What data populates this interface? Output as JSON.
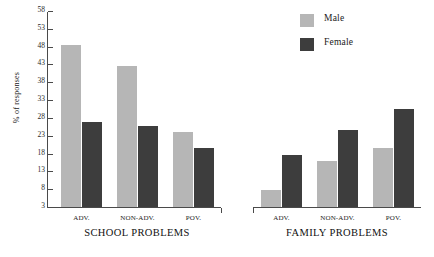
{
  "chart_data": {
    "type": "bar",
    "title": "",
    "xlabel": "",
    "ylabel": "% of responses",
    "ylim": [
      3,
      58
    ],
    "yticks": [
      3,
      8,
      13,
      18,
      23,
      28,
      33,
      38,
      43,
      48,
      53,
      58
    ],
    "grid": false,
    "legend_position": "top-right",
    "categories": [
      "ADV.",
      "NON-ADV.",
      "POV."
    ],
    "panels": [
      {
        "name": "SCHOOL PROBLEMS",
        "categories": [
          "ADV.",
          "NON-ADV.",
          "POV."
        ],
        "series": [
          {
            "name": "Male",
            "color": "#b6b6b6",
            "values": [
              48.5,
              42.5,
              24.0
            ]
          },
          {
            "name": "Female",
            "color": "#3d3d3d",
            "values": [
              26.8,
              25.6,
              19.6
            ]
          }
        ]
      },
      {
        "name": "FAMILY PROBLEMS",
        "categories": [
          "ADV.",
          "NON-ADV.",
          "POV."
        ],
        "series": [
          {
            "name": "Male",
            "color": "#b6b6b6",
            "values": [
              7.9,
              15.9,
              19.6
            ]
          },
          {
            "name": "Female",
            "color": "#3d3d3d",
            "values": [
              17.6,
              24.6,
              30.6
            ]
          }
        ]
      }
    ],
    "legend": [
      {
        "label": "Male",
        "color": "#b6b6b6"
      },
      {
        "label": "Female",
        "color": "#3d3d3d"
      }
    ]
  },
  "axis": {
    "y_label": "% of responses",
    "tick_labels": [
      "58",
      "53",
      "48",
      "43",
      "38",
      "33",
      "28",
      "23",
      "18",
      "13",
      "8",
      "3"
    ]
  },
  "panel_titles": {
    "school": "SCHOOL PROBLEMS",
    "family": "FAMILY PROBLEMS"
  },
  "category_labels": {
    "school": [
      "ADV.",
      "NON-ADV.",
      "POV."
    ],
    "family": [
      "ADV.",
      "NON-ADV.",
      "POV."
    ]
  },
  "legend": {
    "male_label": "Male",
    "female_label": "Female"
  },
  "colors": {
    "male": "#b6b6b6",
    "female": "#3d3d3d",
    "axis": "#4a4a4a",
    "text": "#1a1a1a",
    "background": "#ffffff"
  }
}
